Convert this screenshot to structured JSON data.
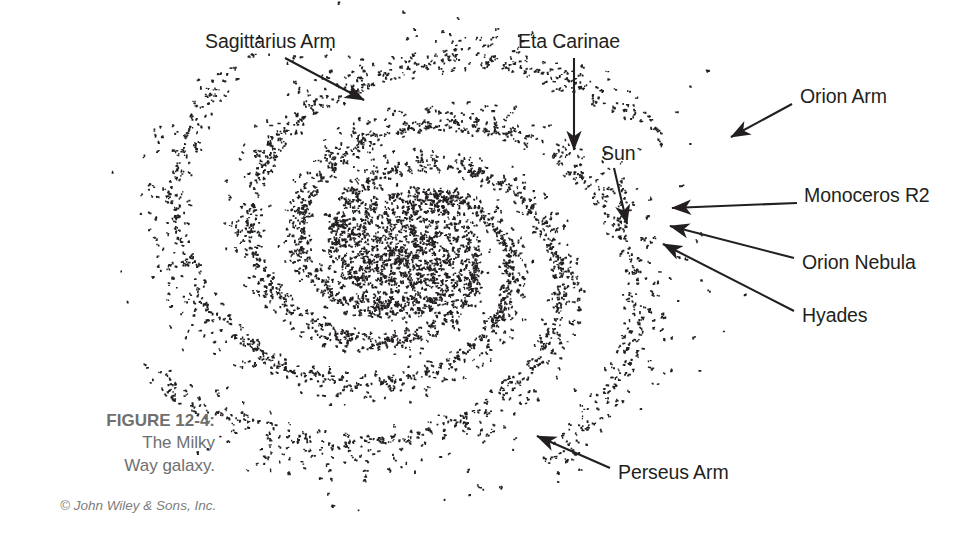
{
  "figure": {
    "title": "FIGURE 12-4:",
    "caption_line1": "The Milky",
    "caption_line2": "Way galaxy.",
    "credit": "© John Wiley & Sons, Inc.",
    "background_color": "#ffffff",
    "ink_color": "#231f20",
    "caption_color": "#6f6f6f"
  },
  "labels": {
    "sagittarius_arm": "Sagittarius Arm",
    "eta_carinae": "Eta Carinae",
    "sun": "Sun",
    "orion_arm": "Orion Arm",
    "monoceros_r2": "Monoceros R2",
    "orion_nebula": "Orion Nebula",
    "hyades": "Hyades",
    "perseus_arm": "Perseus Arm"
  },
  "chart_data": {
    "type": "scatter",
    "title": "The Milky Way galaxy",
    "xlabel": "",
    "ylabel": "",
    "grid": false,
    "legend": "none",
    "center": [
      405,
      252
    ],
    "galaxy_radius": 255,
    "annotations": [
      {
        "label": "Sagittarius Arm",
        "text_xy": [
          205,
          43
        ],
        "arrow_from": [
          285,
          58
        ],
        "arrow_to": [
          364,
          100
        ]
      },
      {
        "label": "Eta Carinae",
        "text_xy": [
          518,
          43
        ],
        "arrow_from": [
          574,
          58
        ],
        "arrow_to": [
          574,
          150
        ]
      },
      {
        "label": "Sun",
        "text_xy": [
          601,
          155
        ],
        "arrow_from": [
          614,
          168
        ],
        "arrow_to": [
          627,
          224
        ]
      },
      {
        "label": "Orion Arm",
        "text_xy": [
          800,
          98
        ],
        "arrow_from": [
          792,
          104
        ],
        "arrow_to": [
          731,
          137
        ]
      },
      {
        "label": "Monoceros R2",
        "text_xy": [
          804,
          197
        ],
        "arrow_from": [
          797,
          203
        ],
        "arrow_to": [
          672,
          208
        ]
      },
      {
        "label": "Orion Nebula",
        "text_xy": [
          802,
          264
        ],
        "arrow_from": [
          794,
          258
        ],
        "arrow_to": [
          670,
          226
        ]
      },
      {
        "label": "Hyades",
        "text_xy": [
          802,
          317
        ],
        "arrow_from": [
          794,
          311
        ],
        "arrow_to": [
          663,
          244
        ]
      },
      {
        "label": "Perseus Arm",
        "text_xy": [
          618,
          474
        ],
        "arrow_from": [
          610,
          468
        ],
        "arrow_to": [
          537,
          436
        ]
      }
    ],
    "arms": [
      {
        "name": "arm-1",
        "start_angle_deg": 0,
        "turns": 1.12
      },
      {
        "name": "arm-2",
        "start_angle_deg": 90,
        "turns": 1.12
      },
      {
        "name": "arm-3",
        "start_angle_deg": 180,
        "turns": 1.12
      },
      {
        "name": "arm-4",
        "start_angle_deg": 270,
        "turns": 1.12
      }
    ],
    "point_count_estimate": 3300
  }
}
